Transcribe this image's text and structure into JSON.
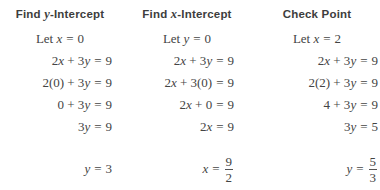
{
  "worksheet": {
    "title_row": [
      "Find y-Intercept",
      "Find x-Intercept",
      "Check Point"
    ],
    "columns": [
      {
        "header_prefix": "Find ",
        "header_var": "y",
        "header_suffix": "-Intercept",
        "let_prefix": "Let ",
        "let_var": "x",
        "let_eq": " = ",
        "let_value": "0",
        "steps": [
          {
            "lhs": "2x + 3y",
            "rel": "=",
            "rhs": "9"
          },
          {
            "lhs": "2(0) + 3y",
            "rel": "=",
            "rhs": "9"
          },
          {
            "lhs": "0 + 3y",
            "rel": "=",
            "rhs": "9"
          },
          {
            "lhs": "3y",
            "rel": "=",
            "rhs": "9"
          }
        ],
        "answer": {
          "lhs": "y",
          "rel": "=",
          "rhs": "3",
          "is_fraction": false,
          "numerator": "",
          "denominator": ""
        }
      },
      {
        "header_prefix": "Find ",
        "header_var": "x",
        "header_suffix": "-Intercept",
        "let_prefix": "Let ",
        "let_var": "y",
        "let_eq": " = ",
        "let_value": "0",
        "steps": [
          {
            "lhs": "2x + 3y",
            "rel": "=",
            "rhs": "9"
          },
          {
            "lhs": "2x + 3(0)",
            "rel": "=",
            "rhs": "9"
          },
          {
            "lhs": "2x + 0",
            "rel": "=",
            "rhs": "9"
          },
          {
            "lhs": "2x",
            "rel": "=",
            "rhs": "9"
          }
        ],
        "answer": {
          "lhs": "x",
          "rel": "=",
          "rhs": "9/2",
          "is_fraction": true,
          "numerator": "9",
          "denominator": "2"
        }
      },
      {
        "header_prefix": "",
        "header_var": "",
        "header_suffix": "Check Point",
        "let_prefix": "Let ",
        "let_var": "x",
        "let_eq": " = ",
        "let_value": "2",
        "steps": [
          {
            "lhs": "2x + 3y",
            "rel": "=",
            "rhs": "9"
          },
          {
            "lhs": "2(2) + 3y",
            "rel": "=",
            "rhs": "9"
          },
          {
            "lhs": "4 + 3y",
            "rel": "=",
            "rhs": "9"
          },
          {
            "lhs": "3y",
            "rel": "=",
            "rhs": "5"
          }
        ],
        "answer": {
          "lhs": "y",
          "rel": "=",
          "rhs": "5/3",
          "is_fraction": true,
          "numerator": "5",
          "denominator": "3"
        }
      }
    ]
  },
  "tokens": {
    "equals": "=",
    "plus": "+"
  },
  "colors": {
    "background": "#ffffff",
    "text": "#444444",
    "header_text": "#3d3d3d",
    "rule": "#555555"
  }
}
